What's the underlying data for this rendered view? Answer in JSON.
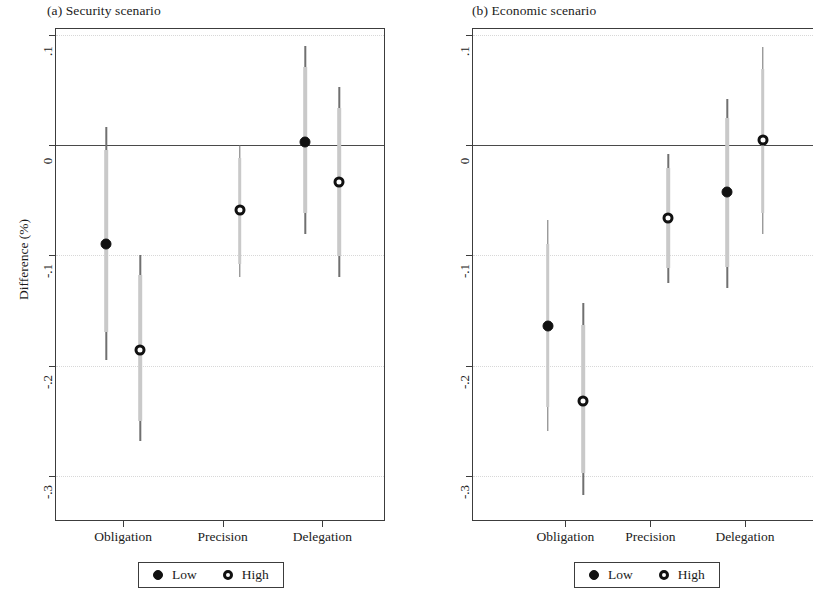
{
  "figure": {
    "ylabel": "Difference (%)"
  },
  "legend": {
    "low_label": "Low",
    "high_label": "High"
  },
  "chart_data": [
    {
      "type": "scatter",
      "title": "(a) Security scenario",
      "xlabel": "",
      "ylabel": "Difference (%)",
      "ylim": [
        -0.34,
        0.105
      ],
      "yticks": [
        0.1,
        0,
        -0.1,
        -0.2,
        -0.3
      ],
      "ytick_labels": [
        ".1",
        "0",
        "-.1",
        "-.2",
        "-.3"
      ],
      "categories": [
        "Obligation",
        "Precision",
        "Delegation"
      ],
      "grid": "horizontal dotted",
      "zero_reference_line": 0,
      "legend_position": "below plot, centered",
      "series": [
        {
          "name": "Low",
          "marker": "filled-circle",
          "points": [
            {
              "category": "Obligation",
              "value": -0.09,
              "ci_low": -0.195,
              "ci_high": 0.016,
              "ci_inner_low": -0.17,
              "ci_inner_high": -0.005
            },
            {
              "category": "Precision",
              "value": null,
              "ci_low": null,
              "ci_high": null
            },
            {
              "category": "Delegation",
              "value": 0.003,
              "ci_low": -0.081,
              "ci_high": 0.09,
              "ci_inner_low": -0.062,
              "ci_inner_high": 0.071
            }
          ]
        },
        {
          "name": "High",
          "marker": "open-circle",
          "points": [
            {
              "category": "Obligation",
              "value": -0.186,
              "ci_low": -0.268,
              "ci_high": -0.1,
              "ci_inner_low": -0.25,
              "ci_inner_high": -0.118
            },
            {
              "category": "Precision",
              "value": -0.059,
              "ci_low": -0.12,
              "ci_high": 0.0,
              "ci_inner_low": -0.108,
              "ci_inner_high": -0.012
            },
            {
              "category": "Delegation",
              "value": -0.034,
              "ci_low": -0.12,
              "ci_high": 0.052,
              "ci_inner_low": -0.101,
              "ci_inner_high": 0.033
            }
          ]
        }
      ]
    },
    {
      "type": "scatter",
      "title": "(b) Economic scenario",
      "xlabel": "",
      "ylabel": "Difference (%)",
      "ylim": [
        -0.34,
        0.105
      ],
      "yticks": [
        0.1,
        0,
        -0.1,
        -0.2,
        -0.3
      ],
      "ytick_labels": [
        ".1",
        "0",
        "-.1",
        "-.2",
        "-.3"
      ],
      "categories": [
        "Obligation",
        "Precision",
        "Delegation"
      ],
      "grid": "horizontal dotted",
      "zero_reference_line": 0,
      "legend_position": "below plot, centered",
      "series": [
        {
          "name": "Low",
          "marker": "filled-circle",
          "points": [
            {
              "category": "Obligation",
              "value": -0.164,
              "ci_low": -0.259,
              "ci_high": -0.068,
              "ci_inner_low": -0.238,
              "ci_inner_high": -0.09
            },
            {
              "category": "Precision",
              "value": null,
              "ci_low": null,
              "ci_high": null
            },
            {
              "category": "Delegation",
              "value": -0.043,
              "ci_low": -0.13,
              "ci_high": 0.042,
              "ci_inner_low": -0.111,
              "ci_inner_high": 0.024
            }
          ]
        },
        {
          "name": "High",
          "marker": "open-circle",
          "points": [
            {
              "category": "Obligation",
              "value": -0.232,
              "ci_low": -0.317,
              "ci_high": -0.143,
              "ci_inner_low": -0.297,
              "ci_inner_high": -0.163
            },
            {
              "category": "Precision",
              "value": -0.066,
              "ci_low": -0.125,
              "ci_high": -0.008,
              "ci_inner_low": -0.112,
              "ci_inner_high": -0.021
            },
            {
              "category": "Delegation",
              "value": 0.004,
              "ci_low": -0.081,
              "ci_high": 0.089,
              "ci_inner_low": -0.062,
              "ci_inner_high": 0.069
            }
          ]
        }
      ]
    }
  ]
}
